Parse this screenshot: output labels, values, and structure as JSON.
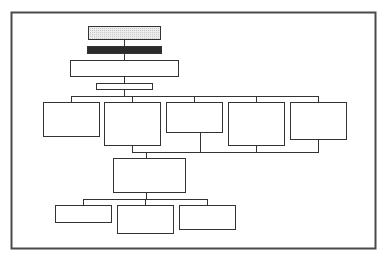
{
  "diagram": {
    "type": "org-chart",
    "title": "",
    "colors": {
      "stroke": "#333333",
      "frame": "#4a4a4a",
      "header_fill": "#e2e2e2",
      "bar_fill": "#2b2b2b",
      "box_fill": "#ffffff"
    },
    "nodes": [
      {
        "id": "top",
        "label": "",
        "level": 0
      },
      {
        "id": "banner",
        "label": "",
        "level": 0
      },
      {
        "id": "main",
        "label": "",
        "level": 1
      },
      {
        "id": "sub",
        "label": "",
        "level": 2
      },
      {
        "id": "a",
        "label": "",
        "level": 3
      },
      {
        "id": "b",
        "label": "",
        "level": 3
      },
      {
        "id": "c",
        "label": "",
        "level": 3
      },
      {
        "id": "d",
        "label": "",
        "level": 3
      },
      {
        "id": "e",
        "label": "",
        "level": 3
      },
      {
        "id": "f",
        "label": "",
        "level": 4
      },
      {
        "id": "g",
        "label": "",
        "level": 5
      },
      {
        "id": "h",
        "label": "",
        "level": 5
      },
      {
        "id": "i",
        "label": "",
        "level": 5
      }
    ],
    "edges": [
      [
        "top",
        "banner"
      ],
      [
        "banner",
        "main"
      ],
      [
        "main",
        "sub"
      ],
      [
        "sub",
        "a"
      ],
      [
        "sub",
        "b"
      ],
      [
        "sub",
        "c"
      ],
      [
        "sub",
        "d"
      ],
      [
        "sub",
        "e"
      ],
      [
        "b",
        "f"
      ],
      [
        "c",
        "f"
      ],
      [
        "d",
        "f"
      ],
      [
        "e",
        "f"
      ],
      [
        "f",
        "g"
      ],
      [
        "f",
        "h"
      ],
      [
        "f",
        "i"
      ]
    ]
  }
}
